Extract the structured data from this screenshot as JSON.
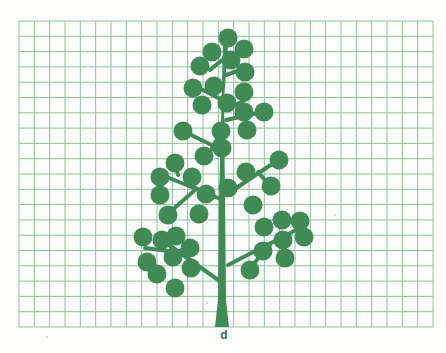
{
  "figure": {
    "label": "d",
    "colors": {
      "tree": "#3f8a55",
      "grid": "#8fc29b",
      "background": "#fdfdfb",
      "label": "#3e6b4a"
    },
    "grid": {
      "x0": 19,
      "y0": 21,
      "x1": 433,
      "y1": 327,
      "cell": 15.3,
      "cols": 27,
      "rows": 20
    },
    "circle_radius": 9.5,
    "trunk": [
      [
        215,
        327
      ],
      [
        229,
        327
      ],
      [
        226,
        300
      ],
      [
        225,
        200
      ],
      [
        224,
        100
      ],
      [
        228,
        45
      ],
      [
        223,
        45
      ],
      [
        219,
        200
      ],
      [
        218,
        300
      ]
    ],
    "branches": [
      [
        [
          222,
          60
        ],
        [
          210,
          70
        ]
      ],
      [
        [
          226,
          75
        ],
        [
          240,
          70
        ]
      ],
      [
        [
          222,
          100
        ],
        [
          203,
          90
        ]
      ],
      [
        [
          226,
          110
        ],
        [
          245,
          100
        ]
      ],
      [
        [
          222,
          130
        ],
        [
          211,
          150
        ]
      ],
      [
        [
          226,
          120
        ],
        [
          262,
          112
        ]
      ],
      [
        [
          222,
          150
        ],
        [
          185,
          132
        ]
      ],
      [
        [
          223,
          200
        ],
        [
          162,
          175
        ]
      ],
      [
        [
          178,
          175
        ],
        [
          175,
          165
        ]
      ],
      [
        [
          190,
          185
        ],
        [
          207,
          194
        ]
      ],
      [
        [
          195,
          190
        ],
        [
          170,
          212
        ]
      ],
      [
        [
          226,
          195
        ],
        [
          278,
          160
        ]
      ],
      [
        [
          245,
          180
        ],
        [
          248,
          172
        ]
      ],
      [
        [
          258,
          172
        ],
        [
          270,
          186
        ]
      ],
      [
        [
          221,
          282
        ],
        [
          162,
          240
        ]
      ],
      [
        [
          190,
          262
        ],
        [
          185,
          270
        ]
      ],
      [
        [
          175,
          252
        ],
        [
          145,
          248
        ]
      ],
      [
        [
          178,
          252
        ],
        [
          185,
          248
        ]
      ],
      [
        [
          228,
          265
        ],
        [
          300,
          228
        ]
      ],
      [
        [
          270,
          245
        ],
        [
          250,
          268
        ]
      ],
      [
        [
          285,
          238
        ],
        [
          283,
          256
        ]
      ]
    ],
    "circles": [
      [
        228,
        38
      ],
      [
        212,
        52
      ],
      [
        244,
        49
      ],
      [
        200,
        66
      ],
      [
        231,
        60
      ],
      [
        245,
        72
      ],
      [
        193,
        88
      ],
      [
        214,
        86
      ],
      [
        244,
        92
      ],
      [
        202,
        105
      ],
      [
        227,
        103
      ],
      [
        244,
        112
      ],
      [
        264,
        112
      ],
      [
        183,
        131
      ],
      [
        221,
        131
      ],
      [
        247,
        130
      ],
      [
        204,
        156
      ],
      [
        222,
        148
      ],
      [
        175,
        163
      ],
      [
        160,
        177
      ],
      [
        192,
        177
      ],
      [
        279,
        160
      ],
      [
        246,
        172
      ],
      [
        160,
        195
      ],
      [
        206,
        194
      ],
      [
        228,
        188
      ],
      [
        271,
        186
      ],
      [
        168,
        215
      ],
      [
        199,
        214
      ],
      [
        253,
        205
      ],
      [
        282,
        220
      ],
      [
        300,
        221
      ],
      [
        264,
        227
      ],
      [
        283,
        240
      ],
      [
        304,
        237
      ],
      [
        263,
        251
      ],
      [
        285,
        258
      ],
      [
        143,
        237
      ],
      [
        162,
        240
      ],
      [
        176,
        236
      ],
      [
        190,
        248
      ],
      [
        147,
        262
      ],
      [
        173,
        257
      ],
      [
        191,
        268
      ],
      [
        157,
        274
      ],
      [
        175,
        288
      ],
      [
        250,
        270
      ]
    ],
    "specks": [
      [
        207,
        303
      ],
      [
        335,
        215
      ],
      [
        47,
        337
      ]
    ]
  }
}
